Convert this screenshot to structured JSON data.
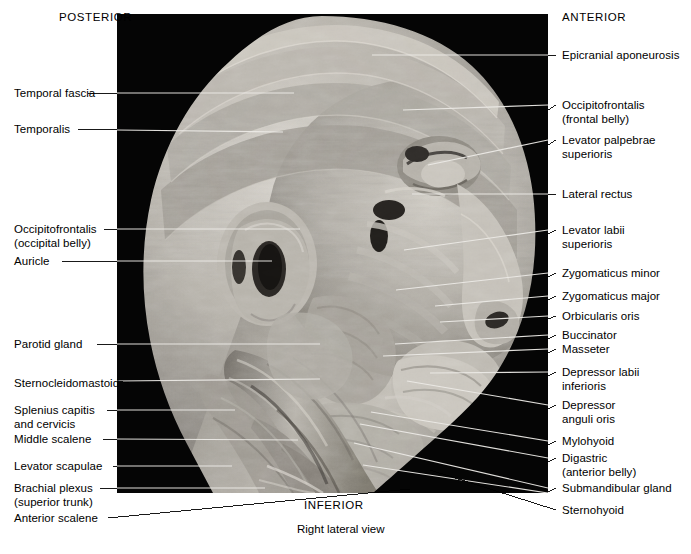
{
  "figure": {
    "caption": "Right lateral view",
    "orientation": {
      "posterior": "POSTERIOR",
      "anterior": "ANTERIOR",
      "inferior": "INFERIOR"
    }
  },
  "labels_left": [
    {
      "id": "temporal-fascia",
      "text": "Temporal fascia",
      "x": 14,
      "y": 88,
      "line_from_x": 113,
      "line_from_y": 93,
      "line_to_x": 294,
      "line_to_y": 93
    },
    {
      "id": "temporalis",
      "text": "Temporalis",
      "x": 14,
      "y": 124,
      "line_from_x": 84,
      "line_from_y": 129,
      "line_to_x": 283,
      "line_to_y": 132
    },
    {
      "id": "occipitofrontalis-occipital",
      "text": "Occipitofrontalis\n(occipital belly)",
      "x": 14,
      "y": 224,
      "line_from_x": 104,
      "line_from_y": 229,
      "line_to_x": 300,
      "line_to_y": 229
    },
    {
      "id": "auricle",
      "text": "Auricle",
      "x": 14,
      "y": 256,
      "line_from_x": 62,
      "line_from_y": 261,
      "line_to_x": 272,
      "line_to_y": 261
    },
    {
      "id": "parotid-gland",
      "text": "Parotid gland",
      "x": 14,
      "y": 339,
      "line_from_x": 97,
      "line_from_y": 344,
      "line_to_x": 320,
      "line_to_y": 344
    },
    {
      "id": "sternocleidomastoid",
      "text": "Sternocleidomastoid",
      "x": 14,
      "y": 378,
      "line_from_x": 129,
      "line_from_y": 383,
      "line_to_x": 320,
      "line_to_y": 379
    },
    {
      "id": "splenius-capitis-cervicis",
      "text": "Splenius capitis\nand cervicis",
      "x": 14,
      "y": 405,
      "line_from_x": 107,
      "line_from_y": 410,
      "line_to_x": 235,
      "line_to_y": 410
    },
    {
      "id": "middle-scalene",
      "text": "Middle scalene",
      "x": 14,
      "y": 434,
      "line_from_x": 103,
      "line_from_y": 439,
      "line_to_x": 298,
      "line_to_y": 440
    },
    {
      "id": "levator-scapulae",
      "text": "Levator scapulae",
      "x": 14,
      "y": 461,
      "line_from_x": 113,
      "line_from_y": 466,
      "line_to_x": 232,
      "line_to_y": 466
    },
    {
      "id": "brachial-plexus",
      "text": "Brachial plexus\n(superior trunk)",
      "x": 14,
      "y": 483,
      "line_from_x": 100,
      "line_from_y": 488,
      "line_to_x": 265,
      "line_to_y": 488
    },
    {
      "id": "anterior-scalene",
      "text": "Anterior scalene",
      "x": 14,
      "y": 513,
      "line_from_x": 108,
      "line_from_y": 518,
      "line_to_x": 290,
      "line_to_y": 492
    }
  ],
  "labels_right": [
    {
      "id": "epicranial-aponeurosis",
      "text": "Epicranial aponeurosis",
      "x": 562,
      "y": 50,
      "line_from_x": 556,
      "line_from_y": 55,
      "line_to_x": 372,
      "line_to_y": 55
    },
    {
      "id": "occipitofrontalis-frontal",
      "text": "Occipitofrontalis\n(frontal belly)",
      "x": 562,
      "y": 100,
      "line_from_x": 556,
      "line_from_y": 105,
      "line_to_x": 403,
      "line_to_y": 110
    },
    {
      "id": "levator-palpebrae",
      "text": "Levator palpebrae\nsuperioris",
      "x": 562,
      "y": 135,
      "line_from_x": 556,
      "line_from_y": 140,
      "line_to_x": 428,
      "line_to_y": 165
    },
    {
      "id": "lateral-rectus",
      "text": "Lateral rectus",
      "x": 562,
      "y": 189,
      "line_from_x": 556,
      "line_from_y": 194,
      "line_to_x": 412,
      "line_to_y": 194
    },
    {
      "id": "levator-labii-superioris",
      "text": "Levator labii\nsuperioris",
      "x": 562,
      "y": 225,
      "line_from_x": 556,
      "line_from_y": 230,
      "line_to_x": 404,
      "line_to_y": 250
    },
    {
      "id": "zygomaticus-minor",
      "text": "Zygomaticus minor",
      "x": 562,
      "y": 268,
      "line_from_x": 556,
      "line_from_y": 273,
      "line_to_x": 396,
      "line_to_y": 290
    },
    {
      "id": "zygomaticus-major",
      "text": "Zygomaticus major",
      "x": 562,
      "y": 291,
      "line_from_x": 556,
      "line_from_y": 296,
      "line_to_x": 435,
      "line_to_y": 306
    },
    {
      "id": "orbicularis-oris",
      "text": "Orbicularis oris",
      "x": 562,
      "y": 311,
      "line_from_x": 556,
      "line_from_y": 316,
      "line_to_x": 440,
      "line_to_y": 322
    },
    {
      "id": "buccinator",
      "text": "Buccinator",
      "x": 562,
      "y": 330,
      "line_from_x": 556,
      "line_from_y": 335,
      "line_to_x": 395,
      "line_to_y": 344
    },
    {
      "id": "masseter",
      "text": "Masseter",
      "x": 562,
      "y": 344,
      "line_from_x": 556,
      "line_from_y": 349,
      "line_to_x": 383,
      "line_to_y": 356
    },
    {
      "id": "depressor-labii-inferioris",
      "text": "Depressor labii\ninferioris",
      "x": 562,
      "y": 367,
      "line_from_x": 556,
      "line_from_y": 372,
      "line_to_x": 430,
      "line_to_y": 373
    },
    {
      "id": "depressor-anguli-oris",
      "text": "Depressor\nanguli oris",
      "x": 562,
      "y": 400,
      "line_from_x": 556,
      "line_from_y": 405,
      "line_to_x": 407,
      "line_to_y": 381
    },
    {
      "id": "mylohyoid",
      "text": "Mylohyoid",
      "x": 562,
      "y": 436,
      "line_from_x": 556,
      "line_from_y": 441,
      "line_to_x": 371,
      "line_to_y": 412
    },
    {
      "id": "digastric-anterior-belly",
      "text": "Digastric\n(anterior belly)",
      "x": 562,
      "y": 453,
      "line_from_x": 556,
      "line_from_y": 458,
      "line_to_x": 360,
      "line_to_y": 424
    },
    {
      "id": "submandibular-gland",
      "text": "Submandibular gland",
      "x": 562,
      "y": 483,
      "line_from_x": 556,
      "line_from_y": 488,
      "line_to_x": 354,
      "line_to_y": 443
    },
    {
      "id": "sternohyoid",
      "text": "Sternohyoid",
      "x": 562,
      "y": 505,
      "line_from_x": 556,
      "line_from_y": 510,
      "line_to_x": 363,
      "line_to_y": 465
    }
  ],
  "directions": [
    {
      "id": "posterior",
      "text": "POSTERIOR",
      "x": 59,
      "y": 17
    },
    {
      "id": "anterior",
      "text": "ANTERIOR",
      "x": 562,
      "y": 17
    },
    {
      "id": "inferior",
      "text": "INFERIOR",
      "x": 304,
      "y": 505
    }
  ],
  "caption": {
    "text": "Right lateral view",
    "x": 297,
    "y": 529
  },
  "colors": {
    "background": "#ffffff",
    "plate_background": "#050505",
    "text": "#000000",
    "leader_line": "#000000",
    "leader_line_on_photo": "#e8e8e8",
    "tissue_light": "#cdc9c2",
    "tissue_mid": "#9d9890",
    "tissue_dark": "#6b6760"
  },
  "photo": {
    "name": "cadaveric-head-neck-dissection-right-lateral",
    "left": 117,
    "top": 14,
    "width": 431,
    "height": 479
  }
}
